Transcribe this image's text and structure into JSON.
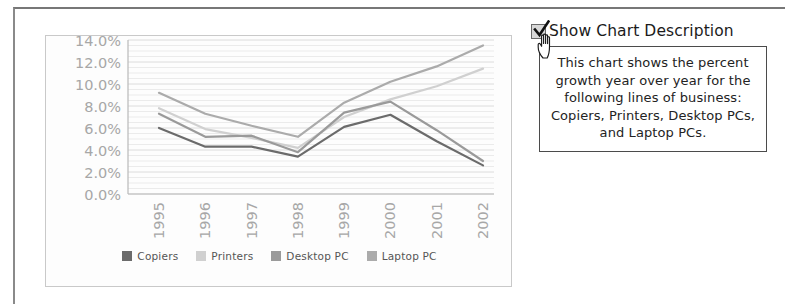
{
  "panel": {
    "checkbox_label": "Show Chart Description",
    "checkbox_checked": true,
    "checkbox_icon": "checkmark-icon",
    "cursor_icon": "hand-pointer-cursor",
    "description": "This chart shows the percent growth year over year for the following lines of business: Copiers, Printers, Desktop PCs, and Laptop PCs."
  },
  "colors": {
    "copiers": "#6b6b6b",
    "printers": "#d0d0d0",
    "desktop_pc": "#9a9a9a",
    "laptop_pc": "#ababab",
    "gridline": "#e4e4e4",
    "axis": "#b9b9b9",
    "tick_text": "#a7a7a7"
  },
  "chart_data": {
    "type": "line",
    "title": "",
    "xlabel": "",
    "ylabel": "",
    "categories": [
      "1995",
      "1996",
      "1997",
      "1998",
      "1999",
      "2000",
      "2001",
      "2002"
    ],
    "ylim": [
      0,
      14
    ],
    "ytick_labels": [
      "0.0%",
      "2.0%",
      "4.0%",
      "6.0%",
      "8.0%",
      "10.0%",
      "12.0%",
      "14.0%"
    ],
    "ytick_values": [
      0,
      2,
      4,
      6,
      8,
      10,
      12,
      14
    ],
    "grid": true,
    "legend_position": "bottom",
    "series": [
      {
        "name": "Copiers",
        "color_key": "copiers",
        "values": [
          6.0,
          4.3,
          4.3,
          3.4,
          6.1,
          7.2,
          4.8,
          2.6
        ]
      },
      {
        "name": "Printers",
        "color_key": "printers",
        "values": [
          7.8,
          5.9,
          5.1,
          4.2,
          7.0,
          8.6,
          9.8,
          11.4
        ]
      },
      {
        "name": "Desktop PC",
        "color_key": "desktop_pc",
        "values": [
          7.3,
          5.2,
          5.3,
          3.8,
          7.4,
          8.4,
          5.8,
          3.0
        ]
      },
      {
        "name": "Laptop PC",
        "color_key": "laptop_pc",
        "values": [
          9.2,
          7.3,
          6.2,
          5.2,
          8.3,
          10.2,
          11.6,
          13.5
        ]
      }
    ]
  }
}
